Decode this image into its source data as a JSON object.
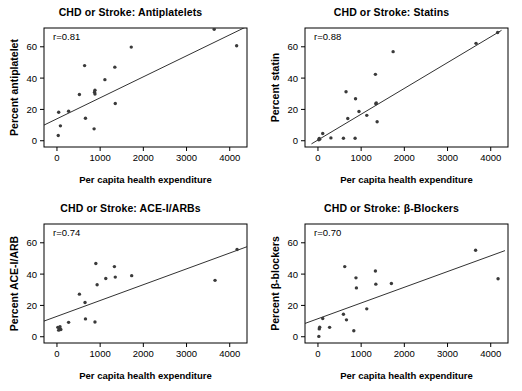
{
  "figure": {
    "panel_count": 4,
    "marker_color": "#3a3a3a",
    "line_color": "#1a1a1a",
    "frame_color": "#000000"
  },
  "chart_data": [
    {
      "type": "scatter",
      "panel_id": "antiplatelets",
      "title": "CHD or Stroke: Antiplatelets",
      "xlabel": "Per capita health expenditure",
      "ylabel": "Percent antiplatelet",
      "annotation": "r=0.81",
      "r": 0.81,
      "xlim": [
        -300,
        4400
      ],
      "ylim": [
        -4,
        72
      ],
      "xticks": [
        0,
        1000,
        2000,
        3000,
        4000
      ],
      "xticklabels": [
        "0",
        "1000",
        "2000",
        "3000",
        "4000"
      ],
      "yticks": [
        0,
        20,
        40,
        60
      ],
      "yticklabels": [
        "0",
        "20",
        "40",
        "60"
      ],
      "grid": false,
      "legend": "none",
      "points": [
        {
          "x": 30,
          "y": 3.3
        },
        {
          "x": 40,
          "y": 18.2
        },
        {
          "x": 80,
          "y": 9.5
        },
        {
          "x": 270,
          "y": 18.8
        },
        {
          "x": 520,
          "y": 29.5
        },
        {
          "x": 640,
          "y": 48.0
        },
        {
          "x": 660,
          "y": 14.4
        },
        {
          "x": 860,
          "y": 7.6
        },
        {
          "x": 870,
          "y": 31.0
        },
        {
          "x": 880,
          "y": 32.2
        },
        {
          "x": 880,
          "y": 29.8
        },
        {
          "x": 1110,
          "y": 39.0
        },
        {
          "x": 1340,
          "y": 47.0
        },
        {
          "x": 1350,
          "y": 23.8
        },
        {
          "x": 1720,
          "y": 59.8
        },
        {
          "x": 3640,
          "y": 71.2
        },
        {
          "x": 4160,
          "y": 60.7
        }
      ],
      "fit_line": {
        "x1": -300,
        "y1": 10.0,
        "x2": 4400,
        "y2": 73.0
      }
    },
    {
      "type": "scatter",
      "panel_id": "statins",
      "title": "CHD or Stroke: Statins",
      "xlabel": "Per capita health expenditure",
      "ylabel": "Percent statin",
      "annotation": "r=0.88",
      "r": 0.88,
      "xlim": [
        -300,
        4400
      ],
      "ylim": [
        -4,
        72
      ],
      "xticks": [
        0,
        1000,
        2000,
        3000,
        4000
      ],
      "xticklabels": [
        "0",
        "1000",
        "2000",
        "3000",
        "4000"
      ],
      "yticks": [
        0,
        20,
        40,
        60
      ],
      "yticklabels": [
        "0",
        "20",
        "40",
        "60"
      ],
      "grid": false,
      "legend": "none",
      "points": [
        {
          "x": 20,
          "y": 0.6
        },
        {
          "x": 30,
          "y": 1.4
        },
        {
          "x": 40,
          "y": 1.0
        },
        {
          "x": 110,
          "y": 4.6
        },
        {
          "x": 300,
          "y": 1.8
        },
        {
          "x": 590,
          "y": 1.6
        },
        {
          "x": 650,
          "y": 31.3
        },
        {
          "x": 690,
          "y": 14.2
        },
        {
          "x": 860,
          "y": 1.6
        },
        {
          "x": 870,
          "y": 26.8
        },
        {
          "x": 950,
          "y": 18.7
        },
        {
          "x": 1130,
          "y": 16.2
        },
        {
          "x": 1330,
          "y": 42.4
        },
        {
          "x": 1340,
          "y": 23.6
        },
        {
          "x": 1350,
          "y": 24.1
        },
        {
          "x": 1370,
          "y": 12.1
        },
        {
          "x": 1740,
          "y": 56.9
        },
        {
          "x": 3660,
          "y": 62.2
        },
        {
          "x": 4160,
          "y": 69.1
        }
      ],
      "fit_line": {
        "x1": -150,
        "y1": -2.0,
        "x2": 4250,
        "y2": 70.5
      }
    },
    {
      "type": "scatter",
      "panel_id": "ace-i-arbs",
      "title": "CHD or Stroke: ACE-I/ARBs",
      "xlabel": "Per capita health expenditure",
      "ylabel": "Percent ACE-I/ARB",
      "annotation": "r=0.74",
      "r": 0.74,
      "xlim": [
        -300,
        4400
      ],
      "ylim": [
        -4,
        72
      ],
      "xticks": [
        0,
        1000,
        2000,
        3000,
        4000
      ],
      "xticklabels": [
        "0",
        "1000",
        "2000",
        "3000",
        "4000"
      ],
      "yticks": [
        0,
        20,
        40,
        60
      ],
      "yticklabels": [
        "0",
        "20",
        "40",
        "60"
      ],
      "grid": false,
      "legend": "none",
      "points": [
        {
          "x": 20,
          "y": 6.0
        },
        {
          "x": 40,
          "y": 4.2
        },
        {
          "x": 60,
          "y": 5.6
        },
        {
          "x": 70,
          "y": 6.4
        },
        {
          "x": 90,
          "y": 4.6
        },
        {
          "x": 270,
          "y": 9.2
        },
        {
          "x": 520,
          "y": 27.2
        },
        {
          "x": 650,
          "y": 21.9
        },
        {
          "x": 660,
          "y": 11.4
        },
        {
          "x": 880,
          "y": 9.4
        },
        {
          "x": 900,
          "y": 46.8
        },
        {
          "x": 930,
          "y": 33.2
        },
        {
          "x": 1130,
          "y": 37.2
        },
        {
          "x": 1330,
          "y": 44.8
        },
        {
          "x": 1350,
          "y": 38.1
        },
        {
          "x": 1730,
          "y": 39.0
        },
        {
          "x": 3660,
          "y": 36.0
        },
        {
          "x": 4170,
          "y": 55.7
        }
      ],
      "fit_line": {
        "x1": -300,
        "y1": 10.0,
        "x2": 4400,
        "y2": 57.5
      }
    },
    {
      "type": "scatter",
      "panel_id": "beta-blockers",
      "title": "CHD or Stroke: β-Blockers",
      "xlabel": "Per capita health expenditure",
      "ylabel": "Percent β-blockers",
      "annotation": "r=0.70",
      "r": 0.7,
      "xlim": [
        -300,
        4400
      ],
      "ylim": [
        -4,
        72
      ],
      "xticks": [
        0,
        1000,
        2000,
        3000,
        4000
      ],
      "xticklabels": [
        "0",
        "1000",
        "2000",
        "3000",
        "4000"
      ],
      "yticks": [
        0,
        20,
        40,
        60
      ],
      "yticklabels": [
        "0",
        "20",
        "40",
        "60"
      ],
      "grid": false,
      "legend": "none",
      "points": [
        {
          "x": 20,
          "y": 0.2
        },
        {
          "x": 30,
          "y": 5.0
        },
        {
          "x": 40,
          "y": 6.1
        },
        {
          "x": 110,
          "y": 11.6
        },
        {
          "x": 270,
          "y": 6.0
        },
        {
          "x": 590,
          "y": 14.4
        },
        {
          "x": 620,
          "y": 44.8
        },
        {
          "x": 660,
          "y": 10.8
        },
        {
          "x": 830,
          "y": 3.8
        },
        {
          "x": 880,
          "y": 37.6
        },
        {
          "x": 890,
          "y": 31.2
        },
        {
          "x": 1130,
          "y": 17.8
        },
        {
          "x": 1330,
          "y": 42.0
        },
        {
          "x": 1340,
          "y": 33.6
        },
        {
          "x": 1700,
          "y": 34.0
        },
        {
          "x": 3650,
          "y": 55.2
        },
        {
          "x": 4170,
          "y": 37.0
        }
      ],
      "fit_line": {
        "x1": -300,
        "y1": 8.5,
        "x2": 4330,
        "y2": 55.0
      }
    }
  ]
}
